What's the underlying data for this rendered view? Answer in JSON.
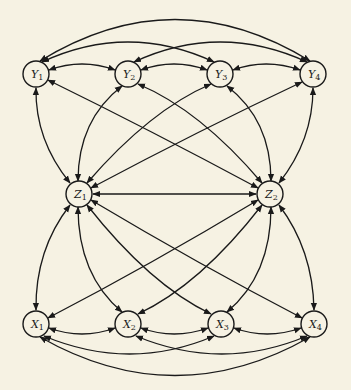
{
  "diagram": {
    "title": "",
    "colors": {
      "background": "#f6f2e3",
      "stroke": "#1a1a1a"
    },
    "nodes": [
      {
        "id": "Y1",
        "base": "Y",
        "sub": "1",
        "x": 36,
        "y": 74
      },
      {
        "id": "Y2",
        "base": "Y",
        "sub": "2",
        "x": 128,
        "y": 74
      },
      {
        "id": "Y3",
        "base": "Y",
        "sub": "3",
        "x": 220,
        "y": 74
      },
      {
        "id": "Y4",
        "base": "Y",
        "sub": "4",
        "x": 313,
        "y": 74
      },
      {
        "id": "Z1",
        "base": "Z",
        "sub": "1",
        "x": 79,
        "y": 194
      },
      {
        "id": "Z2",
        "base": "Z",
        "sub": "2",
        "x": 270,
        "y": 194
      },
      {
        "id": "X1",
        "base": "X",
        "sub": "1",
        "x": 36,
        "y": 324
      },
      {
        "id": "X2",
        "base": "X",
        "sub": "2",
        "x": 128,
        "y": 324
      },
      {
        "id": "X3",
        "base": "X",
        "sub": "3",
        "x": 221,
        "y": 324
      },
      {
        "id": "X4",
        "base": "X",
        "sub": "4",
        "x": 314,
        "y": 324
      }
    ],
    "edges": [
      {
        "from": "Y1",
        "to": "Y2",
        "type": "bidirected",
        "d": "M49,70 Q82,58 115,70"
      },
      {
        "from": "Y2",
        "to": "Y3",
        "type": "bidirected",
        "d": "M141,70 Q174,58 207,70"
      },
      {
        "from": "Y3",
        "to": "Y4",
        "type": "bidirected",
        "d": "M233,70 Q266,58 300,70"
      },
      {
        "from": "Y1",
        "to": "Y3",
        "type": "bidirected",
        "d": "M42,62 Q128,22 214,62"
      },
      {
        "from": "Y2",
        "to": "Y4",
        "type": "bidirected",
        "d": "M134,62 Q220,22 307,62"
      },
      {
        "from": "Y1",
        "to": "Y4",
        "type": "bidirected",
        "d": "M40,61 Q175,-22 310,61"
      },
      {
        "from": "Z1",
        "to": "Y1",
        "type": "bidirected",
        "d": "M70,183 Q35,140 36,88"
      },
      {
        "from": "Z1",
        "to": "Y2",
        "type": "bidirected",
        "d": "M78,181 Q78,120 122,86"
      },
      {
        "from": "Z1",
        "to": "Y3",
        "type": "bidirected",
        "d": "M87,183 Q150,110 211,84"
      },
      {
        "from": "Z1",
        "to": "Y4",
        "type": "bidirected",
        "d": "M91,188 Q200,130 302,82"
      },
      {
        "from": "Z2",
        "to": "Y1",
        "type": "bidirected",
        "d": "M258,188 Q150,130 48,80"
      },
      {
        "from": "Z2",
        "to": "Y2",
        "type": "bidirected",
        "d": "M262,183 Q200,110 138,84"
      },
      {
        "from": "Z2",
        "to": "Y3",
        "type": "bidirected",
        "d": "M271,181 Q271,120 227,86"
      },
      {
        "from": "Z2",
        "to": "Y4",
        "type": "bidirected",
        "d": "M279,183 Q313,140 313,88"
      },
      {
        "from": "Z1",
        "to": "Z2",
        "type": "bidirected",
        "d": "M93,194 L256,194"
      },
      {
        "from": "Z1",
        "to": "X1",
        "type": "bidirected",
        "d": "M70,205 Q35,250 36,310"
      },
      {
        "from": "Z1",
        "to": "X2",
        "type": "bidirected",
        "d": "M78,207 Q78,275 122,312"
      },
      {
        "from": "Z1",
        "to": "X3",
        "type": "bidirected",
        "d": "M87,205 Q150,285 211,314"
      },
      {
        "from": "Z1",
        "to": "X4",
        "type": "bidirected",
        "d": "M91,200 Q200,265 302,318"
      },
      {
        "from": "Z2",
        "to": "X1",
        "type": "bidirected",
        "d": "M258,200 Q150,265 48,318"
      },
      {
        "from": "Z2",
        "to": "X2",
        "type": "bidirected",
        "d": "M262,205 Q200,285 138,314"
      },
      {
        "from": "Z2",
        "to": "X3",
        "type": "bidirected",
        "d": "M271,207 Q271,275 227,312"
      },
      {
        "from": "Z2",
        "to": "X4",
        "type": "bidirected",
        "d": "M279,205 Q313,250 314,310"
      },
      {
        "from": "X1",
        "to": "X2",
        "type": "bidirected",
        "d": "M49,328 Q82,340 115,328"
      },
      {
        "from": "X2",
        "to": "X3",
        "type": "bidirected",
        "d": "M141,328 Q174,340 208,328"
      },
      {
        "from": "X3",
        "to": "X4",
        "type": "bidirected",
        "d": "M234,328 Q267,340 301,328"
      },
      {
        "from": "X1",
        "to": "X3",
        "type": "bidirected",
        "d": "M44,336 Q130,372 214,336"
      },
      {
        "from": "X2",
        "to": "X4",
        "type": "bidirected",
        "d": "M136,336 Q222,372 307,336"
      },
      {
        "from": "X1",
        "to": "X4",
        "type": "bidirected",
        "d": "M40,337 Q175,414 310,337"
      }
    ]
  }
}
